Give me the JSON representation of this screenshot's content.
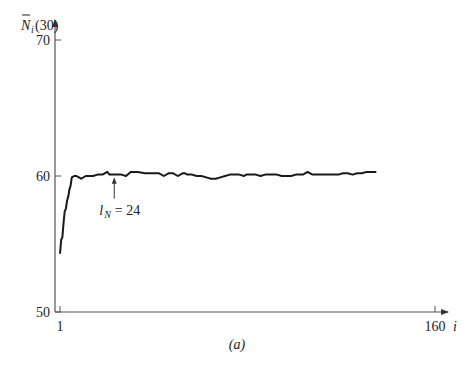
{
  "chart_data": {
    "type": "line",
    "title": "",
    "caption": "(a)",
    "xlabel": "i",
    "ylabel": "N̄i(30)",
    "ylabel_parts": {
      "main": "N",
      "sub": "i",
      "arg": "(30)"
    },
    "xlim": [
      1,
      160
    ],
    "ylim": [
      50,
      70
    ],
    "xticks": [
      1,
      160
    ],
    "xtick_labels": [
      "1",
      "160"
    ],
    "yticks": [
      50,
      60,
      70
    ],
    "ytick_labels": [
      "50",
      "60",
      "70"
    ],
    "grid": false,
    "legend": "none",
    "annotation": {
      "text_main": "l",
      "text_sub": "N",
      "text_rest": " = 24",
      "x": 24,
      "points_to_value": 60.1
    },
    "series": [
      {
        "name": "N̄i(30)",
        "x": [
          1,
          1.5,
          2,
          2.5,
          3,
          3.5,
          4,
          4.5,
          5,
          5.5,
          6,
          7,
          8,
          9,
          10,
          12,
          13,
          15,
          17,
          19,
          21,
          22,
          23,
          25,
          27,
          29,
          31,
          32,
          34,
          37,
          39,
          41,
          43,
          45,
          47,
          49,
          51,
          53,
          54,
          55,
          57,
          59,
          61,
          63,
          65,
          67,
          69,
          71,
          73,
          75,
          77,
          79,
          80,
          82,
          84,
          86,
          88,
          90,
          91,
          93,
          95,
          97,
          99,
          101,
          103,
          104,
          106,
          108,
          110,
          112,
          114,
          116,
          118,
          119,
          121,
          123,
          125,
          127,
          129,
          131,
          133,
          135
        ],
        "values": [
          54.3,
          55.3,
          55.5,
          56.5,
          57.4,
          57.6,
          58.2,
          58.5,
          59.0,
          59.3,
          59.9,
          60.0,
          60.0,
          59.9,
          59.8,
          60.0,
          60.0,
          60.0,
          60.1,
          60.1,
          60.3,
          60.1,
          60.1,
          60.1,
          60.1,
          60.0,
          60.3,
          60.3,
          60.3,
          60.2,
          60.2,
          60.2,
          60.2,
          60.0,
          60.2,
          60.2,
          60.0,
          60.2,
          60.2,
          60.1,
          60.1,
          60.0,
          60.0,
          59.9,
          59.8,
          59.8,
          59.9,
          60.0,
          60.1,
          60.1,
          60.1,
          60.0,
          60.1,
          60.1,
          60.1,
          60.0,
          60.1,
          60.1,
          60.1,
          60.1,
          60.0,
          60.0,
          60.0,
          60.1,
          60.1,
          60.1,
          60.3,
          60.1,
          60.1,
          60.1,
          60.1,
          60.1,
          60.1,
          60.1,
          60.2,
          60.2,
          60.1,
          60.2,
          60.2,
          60.3,
          60.3,
          60.3
        ]
      }
    ]
  }
}
